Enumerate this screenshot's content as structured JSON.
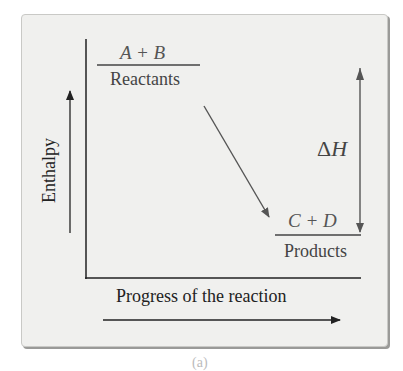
{
  "figure": {
    "type": "enthalpy diagram",
    "reaction_kind": "exothermic",
    "y_axis_label": "Enthalpy",
    "x_axis_label": "Progress of the reaction",
    "reactants": {
      "formula": "A + B",
      "label": "Reactants"
    },
    "products": {
      "formula": "C + D",
      "label": "Products"
    },
    "delta_h": {
      "symbol": "Δ",
      "variable": "H"
    },
    "caption": "(a)"
  },
  "colors": {
    "panel_bg": "#f0f0ee",
    "axis": "#222222",
    "arrow": "#555555",
    "text": "#444444"
  }
}
